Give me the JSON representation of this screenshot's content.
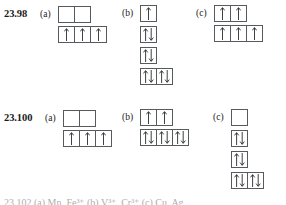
{
  "page": {
    "background": "#ffffff",
    "ink": "#1a1a1a",
    "box_border": "#555a5e",
    "arrow_color": "#2a2a2a"
  },
  "problems": [
    {
      "number": "23.98",
      "parts": [
        {
          "tag": "(a)",
          "layout": "offset-rows",
          "rows": [
            {
              "boxes": [
                {
                  "arrows": []
                },
                {
                  "arrows": []
                }
              ]
            },
            {
              "boxes": [
                {
                  "arrows": [
                    "up"
                  ]
                },
                {
                  "arrows": [
                    "up"
                  ]
                },
                {
                  "arrows": [
                    "up"
                  ]
                }
              ]
            }
          ]
        },
        {
          "tag": "(b)",
          "layout": "vertical-stack",
          "rows": [
            {
              "boxes": [
                {
                  "arrows": [
                    "up"
                  ]
                }
              ]
            },
            {
              "boxes": [
                {
                  "arrows": [
                    "up",
                    "down"
                  ]
                }
              ]
            },
            {
              "boxes": [
                {
                  "arrows": [
                    "up",
                    "down"
                  ]
                }
              ]
            },
            {
              "boxes": [
                {
                  "arrows": [
                    "up",
                    "down"
                  ]
                },
                {
                  "arrows": [
                    "up",
                    "down"
                  ]
                }
              ]
            }
          ]
        },
        {
          "tag": "(c)",
          "layout": "offset-rows",
          "rows": [
            {
              "boxes": [
                {
                  "arrows": [
                    "up"
                  ]
                },
                {
                  "arrows": [
                    "up"
                  ]
                }
              ]
            },
            {
              "boxes": [
                {
                  "arrows": [
                    "up"
                  ]
                },
                {
                  "arrows": [
                    "up"
                  ]
                },
                {
                  "arrows": [
                    "up"
                  ]
                }
              ]
            }
          ]
        }
      ]
    },
    {
      "number": "23.100",
      "parts": [
        {
          "tag": "(a)",
          "layout": "offset-rows",
          "rows": [
            {
              "boxes": [
                {
                  "arrows": []
                },
                {
                  "arrows": []
                }
              ]
            },
            {
              "boxes": [
                {
                  "arrows": [
                    "up"
                  ]
                },
                {
                  "arrows": [
                    "up"
                  ]
                },
                {
                  "arrows": [
                    "up"
                  ]
                }
              ]
            }
          ]
        },
        {
          "tag": "(b)",
          "layout": "offset-rows",
          "rows": [
            {
              "boxes": [
                {
                  "arrows": [
                    "up"
                  ]
                },
                {
                  "arrows": [
                    "up"
                  ]
                }
              ]
            },
            {
              "boxes": [
                {
                  "arrows": [
                    "up",
                    "down"
                  ]
                },
                {
                  "arrows": [
                    "up",
                    "down"
                  ]
                },
                {
                  "arrows": [
                    "up",
                    "down"
                  ]
                }
              ]
            }
          ]
        },
        {
          "tag": "(c)",
          "layout": "vertical-stack",
          "rows": [
            {
              "boxes": [
                {
                  "arrows": []
                }
              ]
            },
            {
              "boxes": [
                {
                  "arrows": [
                    "up",
                    "down"
                  ]
                }
              ]
            },
            {
              "boxes": [
                {
                  "arrows": [
                    "up",
                    "down"
                  ]
                }
              ]
            },
            {
              "boxes": [
                {
                  "arrows": [
                    "up",
                    "down"
                  ]
                },
                {
                  "arrows": [
                    "up",
                    "down"
                  ]
                }
              ]
            }
          ]
        }
      ]
    }
  ],
  "cut_off_footer": {
    "visible": true,
    "text": "23.102 (a) Mn, Fe³⁺  (b) V³⁺, Cr³⁺  (c) Cu, Ag"
  }
}
